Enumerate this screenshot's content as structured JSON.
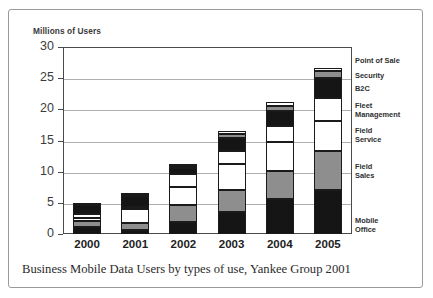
{
  "figure": {
    "caption": "Business Mobile Data Users by types of use, Yankee Group 2001",
    "y_axis_title": "Millions of Users"
  },
  "chart_data": {
    "type": "bar",
    "stacked": true,
    "title": "",
    "subtitle": "",
    "xlabel": "",
    "ylabel": "Millions of Users",
    "ylim": [
      0,
      30
    ],
    "yticks": [
      0,
      5,
      10,
      15,
      20,
      25,
      30
    ],
    "ytick_labels": [
      "0",
      "5",
      "10",
      "15",
      "20",
      "25",
      "30"
    ],
    "grid": true,
    "legend_position": "right",
    "categories": [
      "2000",
      "2001",
      "2002",
      "2003",
      "2004",
      "2005"
    ],
    "series": [
      {
        "name": "Mobile Office",
        "fill": "black",
        "values": [
          1.2,
          0.6,
          2.0,
          3.6,
          5.6,
          7.1
        ]
      },
      {
        "name": "Field Sales",
        "fill": "gray",
        "values": [
          0.9,
          1.1,
          2.6,
          3.4,
          4.5,
          6.2
        ]
      },
      {
        "name": "Field Service",
        "fill": "white",
        "values": [
          0.5,
          2.3,
          2.9,
          4.3,
          4.6,
          4.8
        ]
      },
      {
        "name": "Fleet Management",
        "fill": "white",
        "values": [
          0.6,
          0.3,
          2.2,
          2.0,
          2.6,
          3.8
        ]
      },
      {
        "name": "B2C",
        "fill": "black",
        "values": [
          1.4,
          1.8,
          0.9,
          2.1,
          2.5,
          3.2
        ]
      },
      {
        "name": "Security",
        "fill": "gray",
        "values": [
          0.1,
          0.2,
          0.3,
          0.6,
          0.8,
          1.0
        ]
      },
      {
        "name": "Point of Sale",
        "fill": "white",
        "values": [
          0.1,
          0.2,
          0.2,
          0.5,
          0.6,
          0.5
        ]
      }
    ],
    "totals": [
      4.8,
      6.5,
      11.1,
      16.5,
      21.2,
      26.6
    ],
    "legend_entries": [
      "Point of Sale",
      "Security",
      "B2C",
      "Fleet\nManagement",
      "Field\nService",
      "Field\nSales",
      "Mobile\nOffice"
    ]
  }
}
